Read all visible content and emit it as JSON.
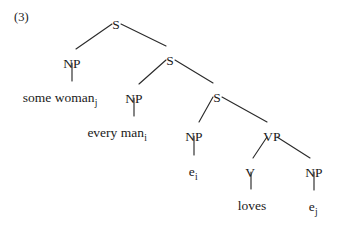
{
  "figure": {
    "example_number": "(3)",
    "background_color": "#ffffff",
    "ink_color": "#1a1a1a",
    "edge_color": "#2b2b2b"
  },
  "tree": {
    "nodes": [
      {
        "id": "s1",
        "label": "S",
        "x": 116,
        "y": 18,
        "kind": "category"
      },
      {
        "id": "np1",
        "label": "NP",
        "x": 72,
        "y": 57,
        "kind": "category"
      },
      {
        "id": "s2",
        "label": "S",
        "x": 170,
        "y": 54,
        "kind": "category"
      },
      {
        "id": "np2",
        "label": "NP",
        "x": 134,
        "y": 92,
        "kind": "category"
      },
      {
        "id": "s3",
        "label": "S",
        "x": 217,
        "y": 91,
        "kind": "category"
      },
      {
        "id": "np3",
        "label": "NP",
        "x": 194,
        "y": 130,
        "kind": "category"
      },
      {
        "id": "vp",
        "label": "VP",
        "x": 272,
        "y": 130,
        "kind": "category"
      },
      {
        "id": "v",
        "label": "V",
        "x": 250,
        "y": 166,
        "kind": "category"
      },
      {
        "id": "np4",
        "label": "NP",
        "x": 314,
        "y": 166,
        "kind": "category"
      }
    ],
    "leaves": [
      {
        "id": "leaf1",
        "text": "some woman",
        "subscript": "j",
        "x": 60,
        "y": 91,
        "parent": "np1"
      },
      {
        "id": "leaf2",
        "text": "every man",
        "subscript": "i",
        "x": 117,
        "y": 126,
        "parent": "np2"
      },
      {
        "id": "leaf3",
        "text": "e",
        "subscript": "i",
        "x": 193,
        "y": 165,
        "parent": "np3"
      },
      {
        "id": "leaf4",
        "text": "loves",
        "subscript": "",
        "x": 252,
        "y": 199,
        "parent": "v"
      },
      {
        "id": "leaf5",
        "text": "e",
        "subscript": "j",
        "x": 313,
        "y": 200,
        "parent": "np4"
      }
    ],
    "edges": [
      {
        "from": "s1",
        "to": "np1",
        "x1": 112,
        "y1": 24,
        "x2": 76,
        "y2": 49
      },
      {
        "from": "s1",
        "to": "s2",
        "x1": 121,
        "y1": 24,
        "x2": 166,
        "y2": 46
      },
      {
        "from": "np1",
        "to": "leaf1",
        "x1": 72,
        "y1": 63,
        "x2": 72,
        "y2": 81
      },
      {
        "from": "s2",
        "to": "np2",
        "x1": 166,
        "y1": 60,
        "x2": 139,
        "y2": 84
      },
      {
        "from": "s2",
        "to": "s3",
        "x1": 175,
        "y1": 60,
        "x2": 213,
        "y2": 83
      },
      {
        "from": "np2",
        "to": "leaf2",
        "x1": 134,
        "y1": 98,
        "x2": 134,
        "y2": 116
      },
      {
        "from": "s3",
        "to": "np3",
        "x1": 213,
        "y1": 97,
        "x2": 199,
        "y2": 122
      },
      {
        "from": "s3",
        "to": "vp",
        "x1": 222,
        "y1": 97,
        "x2": 267,
        "y2": 122
      },
      {
        "from": "np3",
        "to": "leaf3",
        "x1": 194,
        "y1": 136,
        "x2": 194,
        "y2": 155
      },
      {
        "from": "vp",
        "to": "v",
        "x1": 267,
        "y1": 137,
        "x2": 253,
        "y2": 158
      },
      {
        "from": "vp",
        "to": "np4",
        "x1": 277,
        "y1": 137,
        "x2": 310,
        "y2": 158
      },
      {
        "from": "v",
        "to": "leaf4",
        "x1": 251,
        "y1": 172,
        "x2": 251,
        "y2": 189
      },
      {
        "from": "np4",
        "to": "leaf5",
        "x1": 314,
        "y1": 172,
        "x2": 314,
        "y2": 190
      }
    ]
  }
}
